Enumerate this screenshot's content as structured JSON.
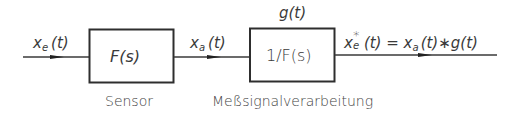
{
  "diagram": {
    "type": "block-diagram",
    "colors": {
      "line": "#3a3a3a",
      "text": "#3a3a3a",
      "background": "#ffffff"
    },
    "input_signal": {
      "base": "x",
      "sub": "e",
      "arg": "(t)"
    },
    "blocks": [
      {
        "id": "sensor",
        "label": "F(s)",
        "caption": "Sensor"
      },
      {
        "id": "processing",
        "label": "1/F(s)",
        "caption": "Meßsignalverarbeitung",
        "top_label": "g(t)"
      }
    ],
    "intermediate_signal": {
      "base": "x",
      "sub": "a",
      "arg": "(t)"
    },
    "output_signal": {
      "lhs_base": "x",
      "lhs_sup": "*",
      "lhs_sub": "e",
      "lhs_arg": "(t)",
      "equals": " = ",
      "rhs": "x",
      "rhs_sub": "a",
      "rhs_rest": "(t)∗g(t)"
    }
  }
}
